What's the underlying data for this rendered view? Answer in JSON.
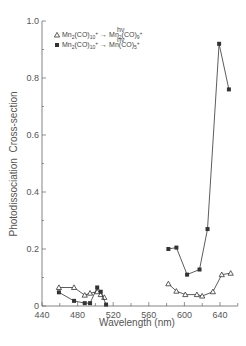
{
  "chart_data": {
    "type": "line",
    "title": "",
    "xlabel": "Wavelength (nm)",
    "ylabel": "Photodissociation  Cross-section",
    "xlim": [
      440,
      660
    ],
    "ylim": [
      0,
      1.0
    ],
    "x_ticks": [
      440,
      480,
      520,
      560,
      600,
      640
    ],
    "x_tick_labels": [
      "440",
      "480",
      "520",
      "560",
      "600",
      "640"
    ],
    "y_ticks": [
      0,
      0.2,
      0.4,
      0.6,
      0.8,
      1.0
    ],
    "y_tick_labels": [
      "0",
      "0.2",
      "0.4",
      "0.6",
      "0.8",
      "1.0"
    ],
    "grid": false,
    "legend_position": "upper left",
    "series": [
      {
        "name": "Mn2(CO)10+ --hv--> Mn2(CO)9+",
        "marker": "open-triangle",
        "segments": [
          {
            "x": [
              459,
              476,
              488,
              494,
              502,
              506,
              510
            ],
            "y": [
              0.065,
              0.065,
              0.038,
              0.045,
              0.05,
              0.04,
              0.03
            ]
          },
          {
            "x": [
              582,
              591,
              601,
              614,
              620,
              632,
              642,
              652
            ],
            "y": [
              0.078,
              0.052,
              0.04,
              0.04,
              0.035,
              0.05,
              0.11,
              0.115
            ]
          }
        ]
      },
      {
        "name": "Mn2(CO)10+ --hv--> Mn(CO)5+",
        "marker": "filled-square",
        "segments": [
          {
            "x": [
              459,
              476,
              488,
              494,
              502,
              506,
              512
            ],
            "y": [
              0.048,
              0.018,
              0.01,
              0.01,
              0.065,
              0.05,
              0.005
            ]
          },
          {
            "x": [
              582,
              591,
              603,
              617,
              626,
              639,
              650
            ],
            "y": [
              0.2,
              0.205,
              0.11,
              0.128,
              0.27,
              0.92,
              0.76
            ]
          }
        ]
      }
    ]
  },
  "legend": {
    "items": [
      {
        "marker": "open-triangle",
        "reactant": "Mn",
        "reactant_sub": "2",
        "reactant_mid": "(CO)",
        "reactant_sub2": "10",
        "reactant_sup": "+",
        "arrow_label": "hν",
        "product": "Mn",
        "product_sub": "2",
        "product_mid": "(CO)",
        "product_sub2": "9",
        "product_sup": "+"
      },
      {
        "marker": "filled-square",
        "reactant": "Mn",
        "reactant_sub": "2",
        "reactant_mid": "(CO)",
        "reactant_sub2": "10",
        "reactant_sup": "+",
        "arrow_label": "hν",
        "product": "Mn",
        "product_sub": "",
        "product_mid": "(CO)",
        "product_sub2": "5",
        "product_sup": "+"
      }
    ]
  },
  "colors": {
    "line": "#333333",
    "axis": "#666666",
    "text": "#555555"
  }
}
